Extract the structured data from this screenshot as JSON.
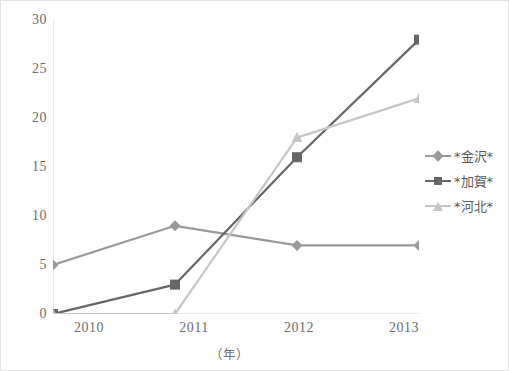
{
  "chart_data": {
    "type": "line",
    "title": "",
    "xlabel": "（年）",
    "ylabel": "",
    "categories": [
      "2010",
      "2011",
      "2012",
      "2013"
    ],
    "xticklabels": [
      "2010",
      "2011",
      "2012",
      "2013"
    ],
    "yticklabels": [
      "0",
      "5",
      "10",
      "15",
      "20",
      "25",
      "30"
    ],
    "ytickvalues": [
      0,
      5,
      10,
      15,
      20,
      25,
      30
    ],
    "ylim": [
      0,
      30
    ],
    "grid": false,
    "legend_position": "right",
    "series": [
      {
        "name": "*金沢*",
        "marker": "diamond",
        "color": "#9a9a9a",
        "values": [
          5,
          9,
          7,
          7
        ]
      },
      {
        "name": "*加賀*",
        "marker": "square",
        "color": "#666666",
        "values": [
          0,
          3,
          16,
          28
        ]
      },
      {
        "name": "*河北*",
        "marker": "triangle",
        "color": "#c6c6c6",
        "values": [
          0,
          0,
          18,
          22
        ]
      }
    ]
  },
  "legend": {
    "items": [
      {
        "label": "*金沢*"
      },
      {
        "label": "*加賀*"
      },
      {
        "label": "*河北*"
      }
    ]
  },
  "axes": {
    "y_labels": [
      "30",
      "25",
      "20",
      "15",
      "10",
      "5",
      "0"
    ],
    "x_labels": [
      "2010",
      "2011",
      "2012",
      "2013"
    ],
    "x_title": "（年）"
  },
  "colors": {
    "series_kanazawa": "#9a9a9a",
    "series_kaga": "#666666",
    "series_kahoku": "#c6c6c6",
    "axis": "#d4d4d4",
    "text": "#6d6d6d",
    "border": "#e2e2e2",
    "background": "#ffffff"
  }
}
